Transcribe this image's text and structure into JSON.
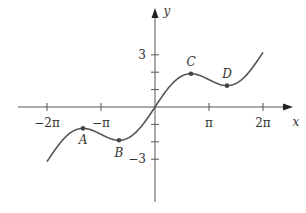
{
  "chart_data": {
    "type": "line",
    "title": "",
    "function": "y = x/2 + sin(x)",
    "xlabel": "x",
    "ylabel": "y",
    "xlim": [
      -6.9,
      7.4
    ],
    "ylim": [
      -5.9,
      6.1
    ],
    "x_range_plotted": [
      -6.2832,
      6.2832
    ],
    "x_ticks": [
      {
        "value": -6.2832,
        "label": "−2π"
      },
      {
        "value": -3.1416,
        "label": "−π"
      },
      {
        "value": 3.1416,
        "label": "π"
      },
      {
        "value": 6.2832,
        "label": "2π"
      }
    ],
    "y_ticks": [
      {
        "value": 3,
        "label": "3"
      },
      {
        "value": 2,
        "label": ""
      },
      {
        "value": 1,
        "label": ""
      },
      {
        "value": -1,
        "label": ""
      },
      {
        "value": -2,
        "label": ""
      },
      {
        "value": -3,
        "label": "−3"
      }
    ],
    "points": [
      {
        "name": "A",
        "x": -4.1888,
        "y": -1.2284
      },
      {
        "name": "B",
        "x": -2.0944,
        "y": -1.9132
      },
      {
        "name": "C",
        "x": 2.0944,
        "y": 1.9132
      },
      {
        "name": "D",
        "x": 4.1888,
        "y": 1.2284
      }
    ],
    "grid": false,
    "legend": null,
    "colors": {
      "curve": "#555555",
      "axis": "#555555",
      "point": "#444444"
    }
  }
}
